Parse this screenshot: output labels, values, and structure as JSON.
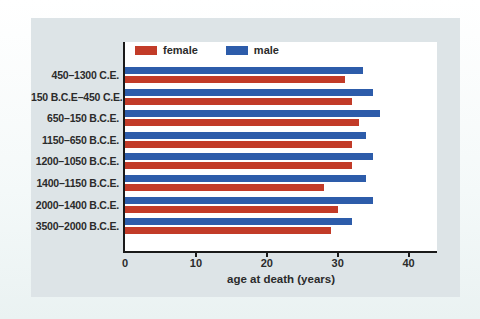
{
  "theme": {
    "page_background": "#f6fafa",
    "panel_background": "#dde4e7",
    "plot_background": "#ffffff",
    "axis_color": "#1a1a1a",
    "text_color": "#2b2b2b"
  },
  "chart_data": {
    "type": "bar",
    "orientation": "horizontal",
    "title": "",
    "xlabel": "age at death (years)",
    "ylabel": "",
    "xlim": [
      0,
      44
    ],
    "x_ticks": [
      0,
      10,
      20,
      30,
      40
    ],
    "grid": false,
    "legend_position": "inside-top-left",
    "categories": [
      "450–1300 C.E.",
      "150 B.C.E–450 C.E.",
      "650–150 B.C.E.",
      "1150–650 B.C.E.",
      "1200–1050 B.C.E.",
      "1400–1150 B.C.E.",
      "2000–1400 B.C.E.",
      "3500–2000 B.C.E."
    ],
    "series": [
      {
        "name": "female",
        "color": "#c23b28",
        "values": [
          31,
          32,
          33,
          32,
          32,
          28,
          30,
          29
        ]
      },
      {
        "name": "male",
        "color": "#2d5caa",
        "values": [
          33.5,
          35,
          36,
          34,
          35,
          34,
          35,
          32
        ]
      }
    ],
    "bar_order_within_group": [
      "male",
      "female"
    ]
  }
}
